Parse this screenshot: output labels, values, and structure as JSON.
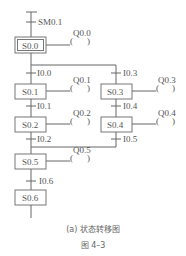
{
  "diagram": {
    "type": "sequential function chart (state transition diagram)",
    "initial_transition": "SM0.1",
    "steps": [
      {
        "id": "S0.0",
        "output": "Q0.0",
        "initial": true
      },
      {
        "id": "S0.1",
        "output": "Q0.1"
      },
      {
        "id": "S0.2",
        "output": "Q0.2"
      },
      {
        "id": "S0.3",
        "output": "Q0.3"
      },
      {
        "id": "S0.4",
        "output": "Q0.4"
      },
      {
        "id": "S0.5",
        "output": "Q0.5"
      },
      {
        "id": "S0.6",
        "output": ""
      }
    ],
    "transitions": {
      "t_sm": "SM0.1",
      "t_10_0": "I0.0",
      "t_10_3": "I0.3",
      "t_10_1": "I0.1",
      "t_10_4": "I0.4",
      "t_10_2": "I0.2",
      "t_10_5": "I0.5",
      "t_10_6": "I0.6"
    },
    "coil_symbol": "(  )"
  },
  "caption": {
    "subtitle": "(a) 状态转移图",
    "figure": "图 4–3"
  }
}
